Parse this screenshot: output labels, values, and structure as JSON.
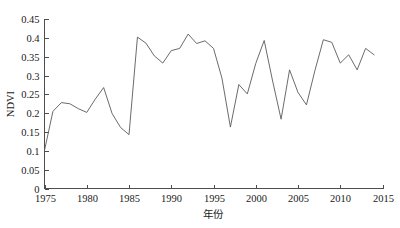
{
  "chart_data": {
    "type": "line",
    "title": "",
    "xlabel": "年份",
    "ylabel": "NDVI",
    "xlim": [
      1975,
      2015
    ],
    "ylim": [
      0,
      0.45
    ],
    "grid": false,
    "legend": null,
    "line_color": "#5a5a5a",
    "axis_color": "#4d4d4d",
    "xticks": [
      1975,
      1980,
      1985,
      1990,
      1995,
      2000,
      2005,
      2010,
      2015
    ],
    "xtick_labels": [
      "1975",
      "1980",
      "1985",
      "1990",
      "1995",
      "2000",
      "2005",
      "2010",
      "2015"
    ],
    "yticks": [
      0,
      0.05,
      0.1,
      0.15,
      0.2,
      0.25,
      0.3,
      0.35,
      0.4,
      0.45
    ],
    "ytick_labels": [
      "0",
      "0.05",
      "0.1",
      "0.15",
      "0.2",
      "0.25",
      "0.3",
      "0.35",
      "0.4",
      "0.45"
    ],
    "series": [
      {
        "name": "NDVI",
        "x": [
          1975,
          1976,
          1977,
          1978,
          1979,
          1980,
          1981,
          1982,
          1983,
          1984,
          1985,
          1986,
          1987,
          1988,
          1989,
          1990,
          1991,
          1992,
          1993,
          1994,
          1995,
          1996,
          1997,
          1998,
          1999,
          2000,
          2001,
          2002,
          2003,
          2004,
          2005,
          2006,
          2007,
          2008,
          2009,
          2010,
          2011,
          2012,
          2013,
          2014
        ],
        "values": [
          0.101,
          0.205,
          0.228,
          0.225,
          0.212,
          0.202,
          0.237,
          0.268,
          0.199,
          0.162,
          0.143,
          0.402,
          0.386,
          0.352,
          0.333,
          0.366,
          0.372,
          0.41,
          0.385,
          0.392,
          0.372,
          0.293,
          0.163,
          0.276,
          0.251,
          0.332,
          0.393,
          0.285,
          0.184,
          0.315,
          0.255,
          0.222,
          0.313,
          0.395,
          0.388,
          0.333,
          0.355,
          0.315,
          0.372,
          0.355
        ]
      }
    ]
  },
  "axes": {
    "ylabel_text": "NDVI",
    "xlabel_text": "年份"
  }
}
